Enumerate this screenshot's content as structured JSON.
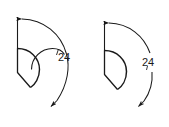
{
  "document": {
    "type": "technical-drawing",
    "title": "Angular dimension sector diagrams",
    "background_color": "#ffffff",
    "line_color": "#1a1a1a",
    "text_color": "#1a1a1a"
  },
  "figures": [
    {
      "id": "left-figure",
      "name": "sector-with-continuous-dimension-arc",
      "dimension_label": "24",
      "dimension_unit": "",
      "notes": "Sector outline with an additional interior arc crossing it; the angular dimension arc is drawn continuously and the value sits beside the arc."
    },
    {
      "id": "right-figure",
      "name": "sector-with-broken-dimension-arc",
      "dimension_label": "24",
      "dimension_unit": "",
      "notes": "Sector outline drawn as a closed D shape; the angular dimension arc is broken with a gap and the value is placed inside the gap."
    }
  ],
  "geometry": {
    "left": {
      "apex_x": 17,
      "apex_y": 48,
      "extension_top_x": 17,
      "extension_top_y": 18,
      "arrow_top_x": 31,
      "arrow_top_y": 19,
      "arrow_bottom_x": 51,
      "arrow_bottom_y": 106,
      "dim_text_x": 57,
      "dim_text_y": 57,
      "sector_radius": 26,
      "dim_radius": 62
    },
    "right": {
      "apex_x": 104,
      "apex_y": 50,
      "extension_top_x": 104,
      "extension_top_y": 22,
      "arrow_top_x": 118,
      "arrow_top_y": 23,
      "arrow_bottom_x": 139,
      "arrow_bottom_y": 106,
      "dim_text_x": 144,
      "dim_text_y": 62,
      "sector_radius": 26,
      "dim_radius": 60
    }
  }
}
